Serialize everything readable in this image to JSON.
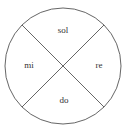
{
  "diagram": {
    "type": "circle-divided-into-four-sectors",
    "stroke_color": "#555555",
    "background": "#ffffff",
    "sectors": [
      {
        "position": "top",
        "label": "sol"
      },
      {
        "position": "right",
        "label": "re"
      },
      {
        "position": "bottom",
        "label": "do"
      },
      {
        "position": "left",
        "label": "mi"
      }
    ]
  }
}
